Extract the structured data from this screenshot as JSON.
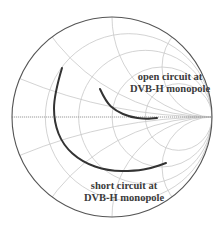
{
  "chart_data": {
    "type": "smith-chart",
    "title": "",
    "center": [
      112,
      117
    ],
    "radius": 100,
    "grid": {
      "resistance_circles": [
        0.2,
        0.5,
        1,
        2
      ],
      "reactance_arcs": [
        0.2,
        0.5,
        1,
        2,
        -0.2,
        -0.5,
        -1,
        -2
      ],
      "color": "#c8c8c8"
    },
    "outer_circle_color": "#555555",
    "real_axis_color": "#9a9a9a",
    "series": [
      {
        "name": "open circuit at DVB-H monopole",
        "color": "#333333",
        "points_px": [
          [
            100,
            89
          ],
          [
            106,
            102
          ],
          [
            116,
            111
          ],
          [
            130,
            117
          ],
          [
            145,
            119
          ],
          [
            157,
            118
          ]
        ]
      },
      {
        "name": "short circuit at DVB-H monopole",
        "color": "#333333",
        "points_px": [
          [
            62,
            68
          ],
          [
            54,
            95
          ],
          [
            54,
            122
          ],
          [
            63,
            145
          ],
          [
            82,
            162
          ],
          [
            108,
            171
          ],
          [
            135,
            171
          ],
          [
            152,
            168
          ],
          [
            166,
            163
          ]
        ]
      }
    ],
    "annotations": [
      {
        "lines": [
          "open circuit at",
          "DVB-H monopole"
        ]
      },
      {
        "lines": [
          "short circuit at",
          "DVB-H monopole"
        ]
      }
    ]
  },
  "labels": {
    "open": {
      "line1": "open circuit at",
      "line2": "DVB-H monopole"
    },
    "short": {
      "line1": "short circuit at",
      "line2": "DVB-H monopole"
    }
  }
}
